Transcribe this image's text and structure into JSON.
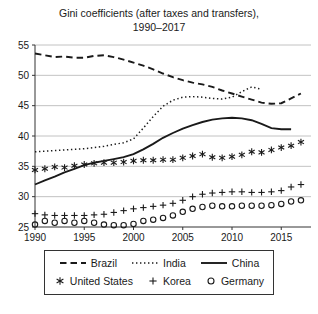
{
  "title": {
    "line1": "Gini coefficients (after taxes and transfers),",
    "line2": "1990–2017"
  },
  "chart_data": {
    "type": "line",
    "title": "Gini coefficients (after taxes and transfers), 1990–2017",
    "xlabel": "",
    "ylabel": "",
    "x_axis": {
      "ticks": [
        1990,
        1995,
        2000,
        2005,
        2010,
        2015
      ],
      "range": [
        1990,
        2018
      ]
    },
    "y_axis": {
      "ticks": [
        25,
        30,
        35,
        40,
        45,
        50,
        55
      ],
      "range": [
        25,
        55
      ]
    },
    "grid": "horizontal",
    "colors": {
      "series": "#1a1a1a",
      "grid": "#b3b3b3",
      "axis": "#333333",
      "text": "#1a1a1a"
    },
    "series": [
      {
        "name": "Brazil",
        "render": "line",
        "line_style": "dashed",
        "marker": "none",
        "x_start": 1990,
        "values": [
          53.6,
          53.3,
          53.0,
          53.1,
          52.9,
          52.9,
          53.2,
          53.3,
          53.0,
          52.6,
          52.1,
          51.6,
          51.0,
          50.3,
          49.7,
          49.2,
          48.8,
          48.5,
          48.1,
          47.5,
          47.0,
          46.5,
          46.0,
          45.5,
          45.3,
          45.4,
          46.2,
          47.0
        ]
      },
      {
        "name": "India",
        "render": "line",
        "line_style": "dotted",
        "marker": "none",
        "x_start": 1990,
        "values": [
          37.4,
          37.5,
          37.6,
          37.7,
          37.8,
          37.9,
          38.1,
          38.3,
          38.6,
          38.9,
          39.5,
          41.3,
          43.2,
          44.9,
          45.9,
          46.4,
          46.5,
          46.4,
          46.2,
          46.1,
          46.4,
          47.3,
          48.1,
          47.7
        ]
      },
      {
        "name": "China",
        "render": "line",
        "line_style": "solid",
        "marker": "none",
        "x_start": 1990,
        "values": [
          32.0,
          32.7,
          33.3,
          34.0,
          34.6,
          35.2,
          35.6,
          35.9,
          36.2,
          36.5,
          37.0,
          37.8,
          38.7,
          39.7,
          40.5,
          41.2,
          41.8,
          42.3,
          42.7,
          42.9,
          43.0,
          42.9,
          42.6,
          42.0,
          41.3,
          41.1,
          41.1
        ]
      },
      {
        "name": "United States",
        "render": "markers",
        "line_style": "none",
        "marker": "asterisk",
        "x_start": 1990,
        "values": [
          34.4,
          34.6,
          34.9,
          34.8,
          35.1,
          35.3,
          35.5,
          35.6,
          35.6,
          35.7,
          35.9,
          36.0,
          36.0,
          36.1,
          36.1,
          36.4,
          36.7,
          37.0,
          36.5,
          36.4,
          36.6,
          36.9,
          37.4,
          37.3,
          37.7,
          38.1,
          38.4,
          39.0
        ]
      },
      {
        "name": "Korea",
        "render": "markers",
        "line_style": "none",
        "marker": "plus",
        "x_start": 1990,
        "values": [
          27.2,
          27.0,
          26.9,
          26.9,
          26.9,
          26.9,
          27.0,
          27.1,
          27.4,
          27.7,
          28.0,
          28.2,
          28.4,
          28.6,
          28.9,
          29.4,
          30.0,
          30.4,
          30.6,
          30.7,
          30.8,
          30.8,
          30.7,
          30.7,
          30.8,
          31.0,
          31.6,
          32.0
        ]
      },
      {
        "name": "Germany",
        "render": "markers",
        "line_style": "none",
        "marker": "circle",
        "x_start": 1990,
        "values": [
          25.4,
          26.0,
          25.7,
          26.0,
          25.7,
          26.0,
          25.7,
          25.4,
          25.3,
          25.3,
          25.5,
          26.0,
          26.2,
          26.5,
          26.9,
          27.5,
          28.0,
          28.3,
          28.5,
          28.4,
          28.4,
          28.5,
          28.5,
          28.5,
          28.6,
          28.8,
          29.2,
          29.4
        ]
      }
    ],
    "legend": {
      "position": "bottom",
      "rows": [
        [
          "Brazil",
          "India",
          "China"
        ],
        [
          "United States",
          "Korea",
          "Germany"
        ]
      ]
    }
  }
}
